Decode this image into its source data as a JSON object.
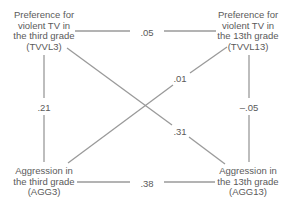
{
  "diagram": {
    "type": "cross-lagged panel correlation",
    "nodes": {
      "tvvl3": {
        "lines": [
          "Preference for",
          "violent TV in",
          "the third grade",
          "(TVVL3)"
        ]
      },
      "tvvl13": {
        "lines": [
          "Preference for",
          "violent TV in",
          "the 13th grade",
          "(TVVL13)"
        ]
      },
      "agg3": {
        "lines": [
          "Aggression in",
          "the third grade",
          "(AGG3)"
        ]
      },
      "agg13": {
        "lines": [
          "Aggression in",
          "the 13th grade",
          "(AGG13)"
        ]
      }
    },
    "edges": [
      {
        "from": "TVVL3",
        "to": "TVVL13",
        "value": ".05"
      },
      {
        "from": "AGG3",
        "to": "AGG13",
        "value": ".38"
      },
      {
        "from": "TVVL3",
        "to": "AGG3",
        "value": ".21"
      },
      {
        "from": "TVVL13",
        "to": "AGG13",
        "value": "–.05"
      },
      {
        "from": "AGG3",
        "to": "TVVL13",
        "value": ".01"
      },
      {
        "from": "TVVL3",
        "to": "AGG13",
        "value": ".31"
      }
    ],
    "colors": {
      "line": "#9a9a9a",
      "text": "#5a5a5a",
      "background": "#ffffff"
    }
  }
}
